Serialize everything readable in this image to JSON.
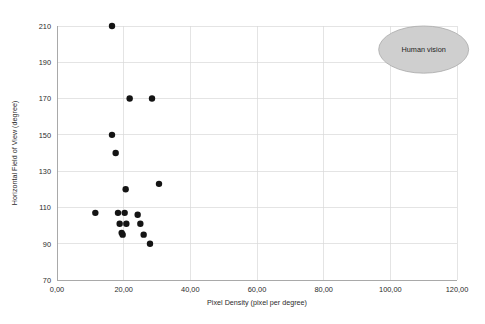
{
  "chart_data": {
    "type": "scatter",
    "title": "",
    "xlabel": "Pixel Density (pixel per degree)",
    "ylabel": "Horizontal Field of View (degree)",
    "xlim": [
      0,
      120
    ],
    "ylim": [
      70,
      210
    ],
    "grid": true,
    "legend": "none",
    "xticks": [
      0,
      20,
      40,
      60,
      80,
      100,
      120
    ],
    "xtick_labels": [
      "0,00",
      "20,00",
      "40,00",
      "60,00",
      "80,00",
      "100,00",
      "120,00"
    ],
    "yticks": [
      70,
      90,
      110,
      130,
      150,
      170,
      190,
      210
    ],
    "ytick_labels": [
      "70",
      "90",
      "110",
      "130",
      "150",
      "170",
      "190",
      "210"
    ],
    "marker": {
      "shape": "circle",
      "color": "#141414",
      "radius_px": 3.2
    },
    "points": [
      {
        "x": 16.5,
        "y": 210
      },
      {
        "x": 21.8,
        "y": 170
      },
      {
        "x": 28.5,
        "y": 170
      },
      {
        "x": 16.5,
        "y": 150
      },
      {
        "x": 17.6,
        "y": 140
      },
      {
        "x": 20.6,
        "y": 120
      },
      {
        "x": 30.6,
        "y": 123
      },
      {
        "x": 11.5,
        "y": 107
      },
      {
        "x": 18.3,
        "y": 107
      },
      {
        "x": 20.3,
        "y": 107
      },
      {
        "x": 24.2,
        "y": 106
      },
      {
        "x": 18.8,
        "y": 101
      },
      {
        "x": 20.8,
        "y": 101
      },
      {
        "x": 25.0,
        "y": 101
      },
      {
        "x": 19.4,
        "y": 96
      },
      {
        "x": 19.7,
        "y": 95
      },
      {
        "x": 26.0,
        "y": 95
      },
      {
        "x": 27.9,
        "y": 90
      }
    ],
    "annotations": [
      {
        "kind": "ellipse",
        "label": "Human vision",
        "center_x": 110.0,
        "center_y": 197.0,
        "width_x": 27.0,
        "height_y": 26.0,
        "fill": "#cfcfcf",
        "stroke": "#a9a9a9"
      }
    ]
  },
  "colors": {
    "background": "#ffffff",
    "grid": "#d8d8d8",
    "axis": "#9a9a9a",
    "text": "#2b2b2b",
    "marker": "#141414",
    "annotation_fill": "#cfcfcf"
  }
}
